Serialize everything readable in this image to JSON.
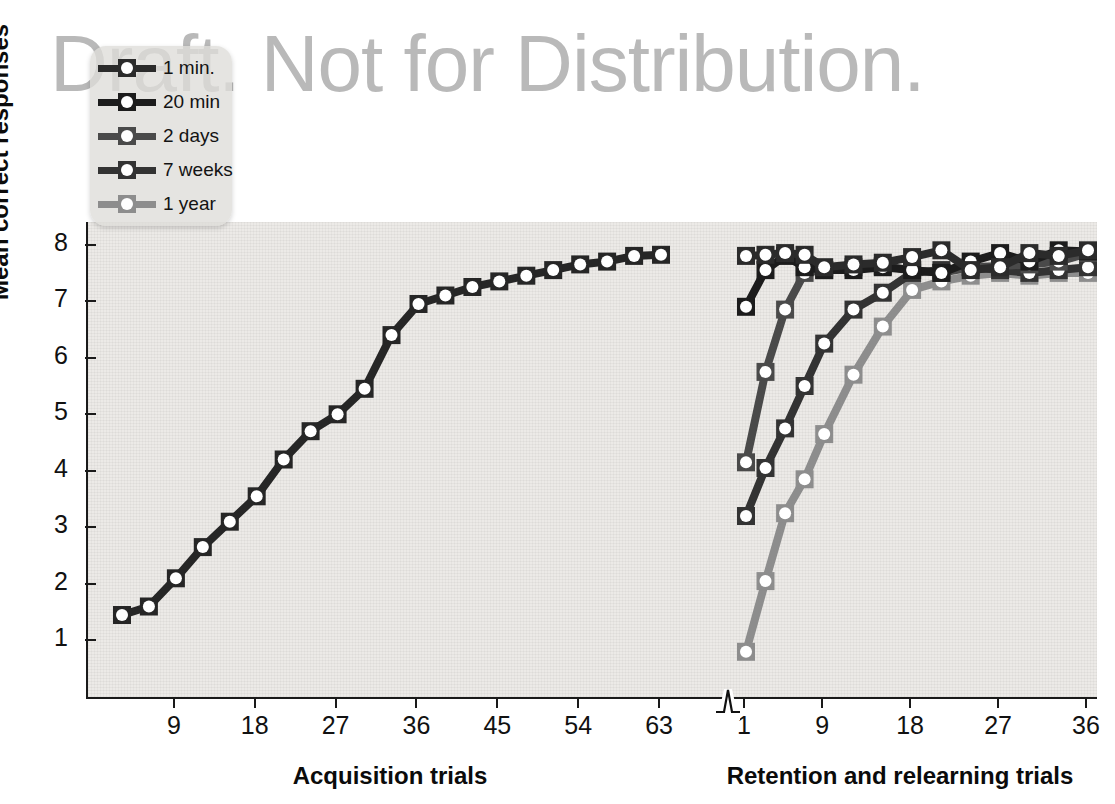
{
  "watermark": {
    "text": "Draft. Not for Distribution."
  },
  "legend": {
    "position": "top-left-inside",
    "items": [
      {
        "label": "1 min.",
        "color": "#2b2b2b"
      },
      {
        "label": "20 min",
        "color": "#1c1c1c"
      },
      {
        "label": "2 days",
        "color": "#4a4a4a"
      },
      {
        "label": "7 weeks",
        "color": "#333333"
      },
      {
        "label": "1 year",
        "color": "#8d8d8d"
      }
    ]
  },
  "chart_data": {
    "type": "line",
    "title": "",
    "ylabel": "Mean correct responses",
    "ylim": [
      0,
      8.4
    ],
    "yticks": [
      1,
      2,
      3,
      4,
      5,
      6,
      7,
      8
    ],
    "ytick_labels": [
      "1",
      "2",
      "3",
      "4",
      "5",
      "6",
      "7",
      "8"
    ],
    "grid": false,
    "axis_break": true,
    "panels": [
      {
        "name": "acquisition",
        "xlabel": "Acquisition trials",
        "xticks": [
          9,
          18,
          27,
          36,
          45,
          54,
          63
        ],
        "xtick_labels": [
          "9",
          "18",
          "27",
          "36",
          "45",
          "54",
          "63"
        ],
        "xlim": [
          1,
          66
        ],
        "series": [
          {
            "name": "acquisition",
            "color": "#262626",
            "x": [
              3,
              6,
              9,
              12,
              15,
              18,
              21,
              24,
              27,
              30,
              33,
              36,
              39,
              42,
              45,
              48,
              51,
              54,
              57,
              60,
              63
            ],
            "y": [
              1.45,
              1.6,
              2.1,
              2.65,
              3.1,
              3.55,
              4.2,
              4.7,
              5.0,
              5.45,
              6.4,
              6.95,
              7.1,
              7.25,
              7.35,
              7.45,
              7.55,
              7.65,
              7.7,
              7.8,
              7.82
            ]
          }
        ]
      },
      {
        "name": "retention",
        "xlabel": "Retention and relearning trials",
        "xticks": [
          1,
          9,
          18,
          27,
          36
        ],
        "xtick_labels": [
          "1",
          "9",
          "18",
          "27",
          "36"
        ],
        "xlim": [
          1,
          36
        ],
        "series": [
          {
            "name": "1 min.",
            "color": "#2b2b2b",
            "x": [
              1,
              3,
              5,
              7,
              9,
              12,
              15,
              18,
              21,
              24,
              27,
              30,
              33,
              36
            ],
            "y": [
              7.8,
              7.82,
              7.85,
              7.82,
              7.6,
              7.65,
              7.68,
              7.78,
              7.9,
              7.55,
              7.6,
              7.85,
              7.8,
              7.9
            ]
          },
          {
            "name": "20 min",
            "color": "#1c1c1c",
            "x": [
              1,
              3,
              5,
              7,
              9,
              12,
              15,
              18,
              21,
              24,
              27,
              30,
              33,
              36
            ],
            "y": [
              6.9,
              7.55,
              7.8,
              7.6,
              7.55,
              7.55,
              7.6,
              7.55,
              7.5,
              7.7,
              7.85,
              7.7,
              7.9,
              7.88
            ]
          },
          {
            "name": "2 days",
            "color": "#4a4a4a",
            "x": [
              1,
              3,
              5,
              7,
              9,
              12,
              15,
              18,
              21,
              24,
              27,
              30,
              33,
              36
            ],
            "y": [
              4.15,
              5.75,
              6.85,
              7.5,
              7.55,
              7.6,
              7.62,
              7.55,
              7.5,
              7.6,
              7.62,
              7.65,
              7.7,
              7.85
            ]
          },
          {
            "name": "7 weeks",
            "color": "#333333",
            "x": [
              1,
              3,
              5,
              7,
              9,
              12,
              15,
              18,
              21,
              24,
              27,
              30,
              33,
              36
            ],
            "y": [
              3.2,
              4.05,
              4.75,
              5.5,
              6.25,
              6.85,
              7.15,
              7.5,
              7.55,
              7.6,
              7.55,
              7.5,
              7.55,
              7.6
            ]
          },
          {
            "name": "1 year",
            "color": "#8d8d8d",
            "x": [
              1,
              3,
              5,
              7,
              9,
              12,
              15,
              18,
              21,
              24,
              27,
              30,
              33,
              36
            ],
            "y": [
              0.8,
              2.05,
              3.25,
              3.85,
              4.65,
              5.7,
              6.55,
              7.2,
              7.35,
              7.45,
              7.5,
              7.45,
              7.5,
              7.5
            ]
          }
        ]
      }
    ]
  }
}
